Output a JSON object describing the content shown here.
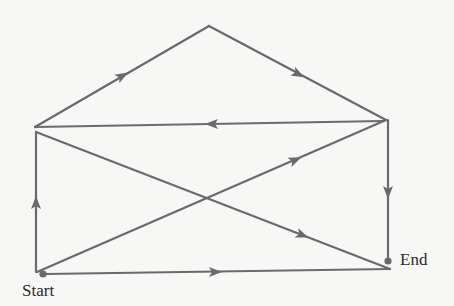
{
  "diagram": {
    "type": "directed-graph-path",
    "colors": {
      "edge": "#6a6a6a",
      "background": "#f7f7f6",
      "text": "#2a2a2a"
    },
    "nodes": [
      {
        "id": "start",
        "label": "Start",
        "x": 43,
        "y": 274,
        "marker": "dot"
      },
      {
        "id": "top-left",
        "x": 35,
        "y": 127
      },
      {
        "id": "apex",
        "x": 209,
        "y": 26
      },
      {
        "id": "top-right",
        "x": 386,
        "y": 120
      },
      {
        "id": "crossing",
        "x": 212,
        "y": 197
      },
      {
        "id": "bottom-right",
        "x": 390,
        "y": 269
      },
      {
        "id": "end",
        "label": "End",
        "x": 388,
        "y": 261,
        "marker": "dot"
      }
    ],
    "edges": [
      {
        "from": "start",
        "to": "top-left",
        "x1": 36,
        "y1": 272,
        "x2": 36,
        "y2": 132,
        "arrow": {
          "x": 36,
          "y": 203,
          "dir": "up"
        }
      },
      {
        "from": "top-left",
        "to": "apex",
        "x1": 35,
        "y1": 127,
        "x2": 209,
        "y2": 26,
        "arrow": {
          "x": 122,
          "y": 76,
          "dir": "up-right"
        }
      },
      {
        "from": "apex",
        "to": "top-right",
        "x1": 209,
        "y1": 26,
        "x2": 386,
        "y2": 120,
        "arrow": {
          "x": 298,
          "y": 74,
          "dir": "down-right"
        }
      },
      {
        "from": "top-right",
        "to": "top-left",
        "x1": 384,
        "y1": 121,
        "x2": 35,
        "y2": 127,
        "arrow": {
          "x": 212,
          "y": 124,
          "dir": "left"
        }
      },
      {
        "from": "top-left",
        "to": "bottom-right",
        "x1": 36,
        "y1": 132,
        "x2": 390,
        "y2": 269,
        "arrow": {
          "x": 302,
          "y": 235,
          "dir": "up-left"
        }
      },
      {
        "from": "start",
        "to": "top-right",
        "x1": 37,
        "y1": 272,
        "x2": 386,
        "y2": 120,
        "arrow": {
          "x": 295,
          "y": 160,
          "dir": "up-right"
        }
      },
      {
        "from": "top-right",
        "to": "end",
        "x1": 388,
        "y1": 120,
        "x2": 388,
        "y2": 261,
        "arrow": {
          "x": 388,
          "y": 192,
          "dir": "down"
        }
      },
      {
        "from": "start",
        "to": "bottom-right",
        "x1": 45,
        "y1": 274,
        "x2": 390,
        "y2": 269,
        "arrow": {
          "x": 215,
          "y": 272,
          "dir": "right"
        }
      }
    ],
    "labels": {
      "start": "Start",
      "end": "End"
    }
  }
}
